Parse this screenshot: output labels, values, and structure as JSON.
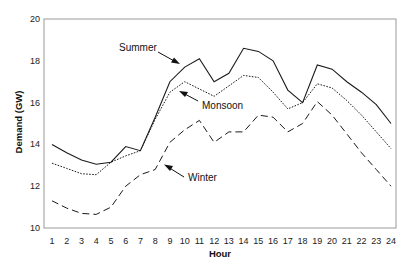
{
  "chart_data": {
    "type": "line",
    "title": "",
    "xlabel": "Hour",
    "ylabel": "Demand (GW)",
    "ylim": [
      10,
      20
    ],
    "yticks": [
      10,
      12,
      14,
      16,
      18,
      20
    ],
    "grid": false,
    "legend": "inline annotations with arrows",
    "x": [
      1,
      2,
      3,
      4,
      5,
      6,
      7,
      8,
      9,
      10,
      11,
      12,
      13,
      14,
      15,
      16,
      17,
      18,
      19,
      20,
      21,
      22,
      23,
      24
    ],
    "series": [
      {
        "name": "Summer",
        "style": "solid",
        "values": [
          14.0,
          13.6,
          13.25,
          13.05,
          13.15,
          13.9,
          13.7,
          15.3,
          17.0,
          17.7,
          18.1,
          17.0,
          17.4,
          18.6,
          18.45,
          18.0,
          16.6,
          16.0,
          17.8,
          17.6,
          17.0,
          16.5,
          15.9,
          15.0
        ]
      },
      {
        "name": "Monsoon",
        "style": "dotted",
        "values": [
          13.1,
          12.85,
          12.6,
          12.55,
          13.15,
          13.45,
          13.7,
          15.2,
          16.5,
          17.0,
          16.65,
          16.3,
          16.8,
          17.3,
          17.2,
          16.5,
          15.7,
          16.0,
          16.9,
          16.7,
          16.1,
          15.4,
          14.6,
          13.8
        ]
      },
      {
        "name": "Winter",
        "style": "dashed",
        "values": [
          11.3,
          10.95,
          10.7,
          10.65,
          11.0,
          12.0,
          12.55,
          12.8,
          14.1,
          14.7,
          15.15,
          14.1,
          14.6,
          14.6,
          15.4,
          15.3,
          14.6,
          15.0,
          16.05,
          15.4,
          14.5,
          13.6,
          12.8,
          12.0
        ]
      }
    ],
    "annotations": [
      {
        "label": "Summer",
        "points_to_hour": 10
      },
      {
        "label": "Monsoon",
        "points_to_hour": 10
      },
      {
        "label": "Winter",
        "points_to_hour": 8
      }
    ]
  }
}
